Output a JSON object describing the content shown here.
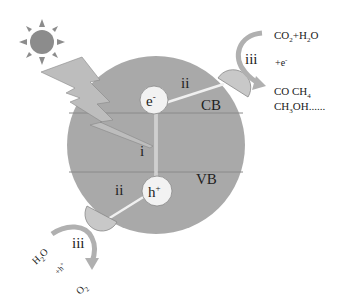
{
  "diagram": {
    "colors": {
      "particle": "#a9a9a9",
      "band_line": "#8a8a8a",
      "carrier_fill": "#f2f2f2",
      "cocatalyst": "#c8c8c8",
      "light": "#bdbdbd",
      "sun": "#8c8c8c",
      "arrow": "#b0b0b0"
    },
    "labels": {
      "electron": "e",
      "electron_sup": "-",
      "hole": "h",
      "hole_sup": "+",
      "conduction_band": "CB",
      "valence_band": "VB",
      "step_excitation": "i",
      "step_migration_e": "ii",
      "step_migration_h": "ii",
      "step_reaction_red": "iii",
      "step_reaction_ox": "iii"
    },
    "reduction": {
      "reactant_a": "CO",
      "reactant_a_sub": "2",
      "plus": "+H",
      "reactant_b_sub": "2",
      "reactant_b_end": "O",
      "reagent": "+e",
      "reagent_sup": "-",
      "product_line1_a": "CO CH",
      "product_line1_sub": "4",
      "product_line2_a": "CH",
      "product_line2_sub": "3",
      "product_line2_b": "OH......"
    },
    "oxidation": {
      "reactant": "H",
      "reactant_sub": "2",
      "reactant_end": "O",
      "reagent": "+h",
      "reagent_sup": "+",
      "product": "O",
      "product_sub": "2"
    }
  }
}
